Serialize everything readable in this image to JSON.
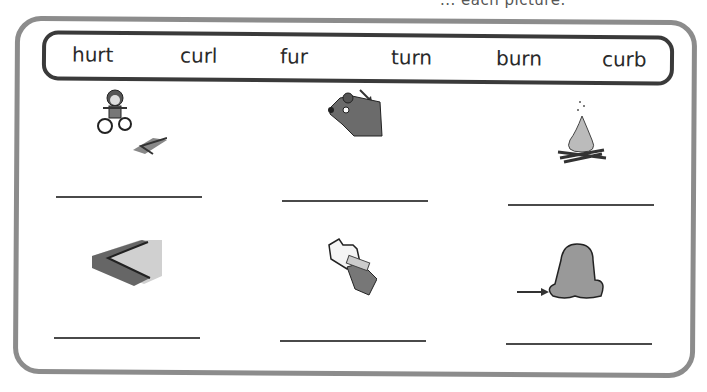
{
  "header": {
    "cropped_instruction": "... each picture."
  },
  "word_bank": [
    "hurt",
    "curl",
    "fur",
    "turn",
    "burn",
    "curb"
  ],
  "items": [
    {
      "picture": "child-on-bike-hitting-curb",
      "answer": ""
    },
    {
      "picture": "bear-with-arrow-pointing-to-fur",
      "answer": ""
    },
    {
      "picture": "campfire",
      "answer": ""
    },
    {
      "picture": "curb-corner",
      "answer": ""
    },
    {
      "picture": "bandaged-hurt-hand",
      "answer": ""
    },
    {
      "picture": "hair-with-arrow-to-curl",
      "answer": ""
    }
  ]
}
